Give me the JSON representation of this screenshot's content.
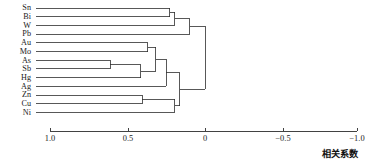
{
  "chart_data": {
    "type": "dendrogram",
    "title": "",
    "subtitle": "",
    "xlabel": "相关系数",
    "ylabel": "",
    "grid": false,
    "legend": null,
    "axis": {
      "orientation": "horizontal-bottom",
      "reversed": true,
      "xlim": [
        1.0,
        -1.0
      ],
      "ticks": [
        {
          "value": 1.0,
          "label": "1.0"
        },
        {
          "value": 0.5,
          "label": "0.5"
        },
        {
          "value": 0.0,
          "label": "0"
        },
        {
          "value": -0.5,
          "label": "−0.5"
        },
        {
          "value": -1.0,
          "label": "−1.0"
        }
      ]
    },
    "leaves": [
      {
        "id": "Sn",
        "label": "Sn"
      },
      {
        "id": "Bi",
        "label": "Bi"
      },
      {
        "id": "W",
        "label": "W"
      },
      {
        "id": "Pb",
        "label": "Pb"
      },
      {
        "id": "Au",
        "label": "Au"
      },
      {
        "id": "Mo",
        "label": "Mo"
      },
      {
        "id": "As",
        "label": "As"
      },
      {
        "id": "Sb",
        "label": "Sb"
      },
      {
        "id": "Hg",
        "label": "Hg"
      },
      {
        "id": "Ag",
        "label": "Ag"
      },
      {
        "id": "Zn",
        "label": "Zn"
      },
      {
        "id": "Cu",
        "label": "Cu"
      },
      {
        "id": "Ni",
        "label": "Ni"
      }
    ],
    "merges": [
      {
        "id": "m1",
        "children": [
          "Sn",
          "Bi"
        ],
        "distance": 0.21
      },
      {
        "id": "m2",
        "children": [
          "m1",
          "W"
        ],
        "distance": 0.18
      },
      {
        "id": "m3",
        "children": [
          "m2",
          "Pb"
        ],
        "distance": 0.09
      },
      {
        "id": "m4",
        "children": [
          "Au",
          "Mo"
        ],
        "distance": 0.34
      },
      {
        "id": "m5",
        "children": [
          "As",
          "Sb"
        ],
        "distance": 0.56
      },
      {
        "id": "m6",
        "children": [
          "m5",
          "Hg"
        ],
        "distance": 0.38
      },
      {
        "id": "m7",
        "children": [
          "m4",
          "m6"
        ],
        "distance": 0.29
      },
      {
        "id": "m8",
        "children": [
          "m7",
          "Ag"
        ],
        "distance": 0.23
      },
      {
        "id": "m9",
        "children": [
          "Zn",
          "Cu"
        ],
        "distance": 0.37
      },
      {
        "id": "m10",
        "children": [
          "m9",
          "Ni"
        ],
        "distance": 0.18
      },
      {
        "id": "m11",
        "children": [
          "m8",
          "m10"
        ],
        "distance": 0.15
      },
      {
        "id": "m12",
        "children": [
          "m3",
          "m11"
        ],
        "distance": 0.0
      }
    ],
    "colors": {
      "line": "#2e2e2e",
      "text": "#1b1b1b",
      "background": "#ffffff"
    }
  },
  "axis_title": "相关系数"
}
